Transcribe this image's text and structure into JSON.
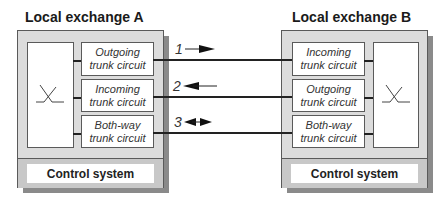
{
  "exchange_a": {
    "title": "Local exchange A",
    "trunks": [
      {
        "line1": "Outgoing",
        "line2": "trunk circuit"
      },
      {
        "line1": "Incoming",
        "line2": "trunk circuit"
      },
      {
        "line1": "Both-way",
        "line2": "trunk circuit"
      }
    ],
    "control": "Control system"
  },
  "exchange_b": {
    "title": "Local exchange B",
    "trunks": [
      {
        "line1": "Incoming",
        "line2": "trunk circuit"
      },
      {
        "line1": "Outgoing",
        "line2": "trunk circuit"
      },
      {
        "line1": "Both-way",
        "line2": "trunk circuit"
      }
    ],
    "control": "Control system"
  },
  "links": [
    {
      "label": "1",
      "direction": "right"
    },
    {
      "label": "2",
      "direction": "left"
    },
    {
      "label": "3",
      "direction": "both"
    }
  ],
  "colors": {
    "frame_fill": "#dcdcdc",
    "shadow": "#8a8a8a",
    "control_band": "#c8c8c8",
    "line": "#222222"
  }
}
